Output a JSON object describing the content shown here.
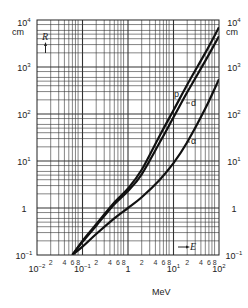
{
  "chart_data": {
    "type": "line",
    "title": "",
    "xlabel": "MeV",
    "ylabel": "cm",
    "x_axis_symbol": "E",
    "y_axis_symbol": "R",
    "x_scale": "log",
    "y_scale": "log",
    "xlim": [
      0.01,
      100
    ],
    "ylim": [
      0.1,
      10000
    ],
    "grid": true,
    "x_decade_labels": [
      "10^-2",
      "10^-1",
      "1",
      "10^1",
      "10^2"
    ],
    "x_minor_labels": [
      "2",
      "4",
      "6",
      "8"
    ],
    "y_decade_labels_left": [
      "10^4",
      "10^3",
      "10^2",
      "10^1",
      "1",
      "10^-1"
    ],
    "y_decade_labels_right": [
      "10^4",
      "10^3",
      "10^2",
      "10^1",
      "1",
      "10^-1"
    ],
    "y_unit_left": "cm",
    "y_unit_right": "cm",
    "series": [
      {
        "name": "p",
        "x": [
          0.06,
          0.1,
          0.2,
          0.5,
          1,
          2,
          5,
          10,
          20,
          50,
          100
        ],
        "values": [
          0.1,
          0.2,
          0.45,
          1.3,
          2.6,
          6.5,
          35,
          120,
          420,
          2000,
          7000
        ]
      },
      {
        "name": "d",
        "x": [
          0.06,
          0.1,
          0.2,
          0.5,
          1,
          2,
          5,
          10,
          20,
          50,
          100
        ],
        "values": [
          0.1,
          0.19,
          0.42,
          1.2,
          2.3,
          5.2,
          25,
          85,
          290,
          1350,
          4500
        ]
      },
      {
        "name": "α",
        "x": [
          0.06,
          0.1,
          0.2,
          0.5,
          1,
          2,
          5,
          10,
          20,
          50,
          100
        ],
        "values": [
          0.1,
          0.15,
          0.28,
          0.6,
          1.0,
          1.7,
          4,
          9,
          25,
          130,
          550
        ]
      }
    ],
    "annotations": [
      "p",
      "d",
      "α",
      "R",
      "E"
    ]
  },
  "labels": {
    "xunit": "MeV",
    "yunit_left": "cm",
    "yunit_right": "cm",
    "p": "p",
    "d": "d",
    "alpha": "α",
    "R": "R",
    "E": "E"
  }
}
